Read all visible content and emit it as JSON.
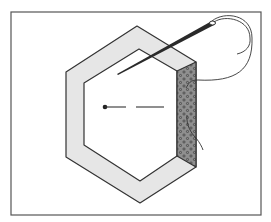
{
  "diagram": {
    "title": "Hexagon patch with fabric edge folded and basted",
    "colors": {
      "background": "#ffffff",
      "frame": "#555555",
      "outline": "#333333",
      "fabric_band": "#e6e6e6",
      "template_face": "#ffffff",
      "folded_edge": "#8c8c8c",
      "dots": "#3a3a3a",
      "needle": "#2a2a2a",
      "thread": "#333333"
    },
    "elements": [
      {
        "id": "frame",
        "label": "border frame"
      },
      {
        "id": "outer-hexagon",
        "label": "fabric hexagon"
      },
      {
        "id": "inner-hexagon",
        "label": "paper template"
      },
      {
        "id": "folded-edge",
        "label": "folded fabric edge (patterned)"
      },
      {
        "id": "needle",
        "label": "needle"
      },
      {
        "id": "thread",
        "label": "thread"
      },
      {
        "id": "basting-line",
        "label": "dashed basting line with dot"
      }
    ]
  }
}
